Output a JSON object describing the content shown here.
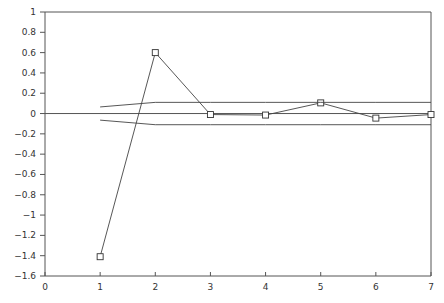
{
  "chart_data": {
    "type": "line",
    "title": "",
    "xlabel": "",
    "ylabel": "",
    "xlim": [
      0,
      7
    ],
    "ylim": [
      -1.6,
      1
    ],
    "grid": false,
    "legend": "none",
    "x_ticks": [
      "0",
      "1",
      "2",
      "3",
      "4",
      "5",
      "6",
      "7"
    ],
    "x_tick_values": [
      0,
      1,
      2,
      3,
      4,
      5,
      6,
      7
    ],
    "y_ticks": [
      "1",
      "0.8",
      "0.6",
      "0.4",
      "0.2",
      "0",
      "−0.2",
      "−0.4",
      "−0.6",
      "−0.8",
      "−1",
      "−1.2",
      "−1.4",
      "−1.6"
    ],
    "y_tick_values": [
      1,
      0.8,
      0.6,
      0.4,
      0.2,
      0,
      -0.2,
      -0.4,
      -0.6,
      -0.8,
      -1,
      -1.2,
      -1.4,
      -1.6
    ],
    "series": [
      {
        "name": "autocorrelation",
        "marker": "square",
        "x": [
          1,
          2,
          3,
          4,
          5,
          6,
          7
        ],
        "values": [
          -1.41,
          0.6,
          -0.01,
          -0.015,
          0.105,
          -0.045,
          -0.01
        ]
      },
      {
        "name": "upper-confidence-bound",
        "marker": "none",
        "x": [
          1,
          2,
          3,
          4,
          5,
          6,
          7
        ],
        "values": [
          0.065,
          0.11,
          0.11,
          0.11,
          0.11,
          0.11,
          0.11
        ]
      },
      {
        "name": "lower-confidence-bound",
        "marker": "none",
        "x": [
          1,
          2,
          3,
          4,
          5,
          6,
          7
        ],
        "values": [
          -0.065,
          -0.11,
          -0.11,
          -0.11,
          -0.11,
          -0.11,
          -0.11
        ]
      }
    ],
    "reference_lines": [
      {
        "name": "zero-line",
        "y": 0
      }
    ]
  }
}
